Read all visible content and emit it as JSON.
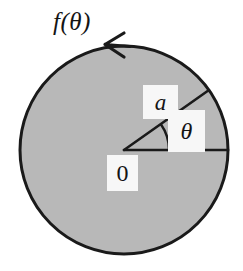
{
  "figure": {
    "type": "polar-disk-diagram",
    "width": 243,
    "height": 271,
    "background_color": "#ffffff",
    "labels": {
      "boundary_function": "f(θ)",
      "radius": "a",
      "angle": "θ",
      "origin": "0"
    },
    "icon_names": {
      "arrow": "counterclockwise-arrow-icon",
      "disk": "filled-disk-shape",
      "arc": "angle-arc-icon"
    },
    "colors": {
      "disk_fill": "#b8b8b8",
      "stroke": "#1a1a1a",
      "label_box_fill": "#f7f7f7",
      "text": "#141414"
    },
    "geometry": {
      "center_x": 124,
      "center_y": 150,
      "radius": 104,
      "radius_line_angle_deg": 35,
      "angle_arc_radius": 45,
      "arrow_position_deg": 108,
      "arrow_direction": "counterclockwise",
      "horizontal_ray_end_x": 228,
      "stroke_width": 3
    }
  }
}
